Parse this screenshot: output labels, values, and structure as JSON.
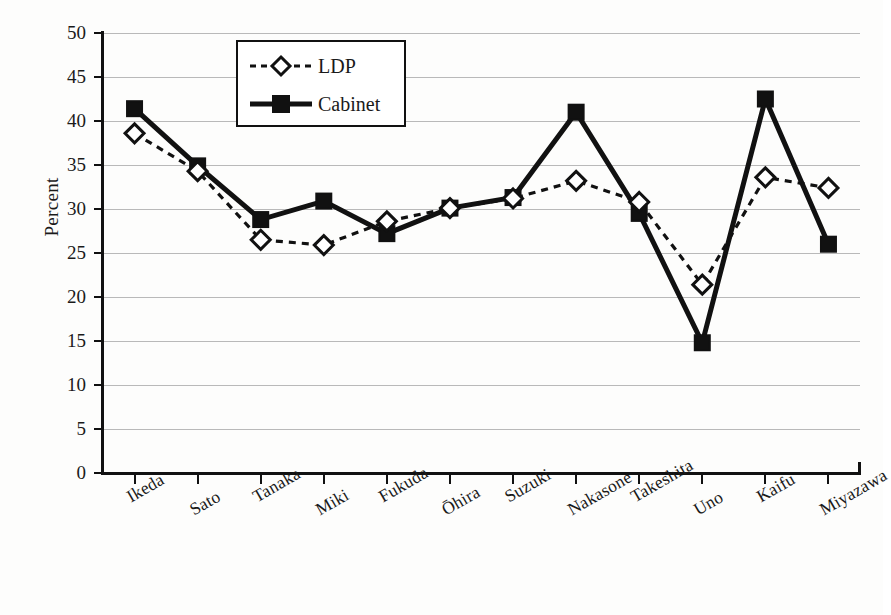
{
  "chart_data": {
    "type": "line",
    "title": "",
    "xlabel": "Politician",
    "ylabel": "Percent",
    "ylim": [
      0,
      50
    ],
    "yticks": [
      0,
      5,
      10,
      15,
      20,
      25,
      30,
      35,
      40,
      45,
      50
    ],
    "grid": "horizontal",
    "legend_position": "top-left-inside",
    "categories": [
      "Ikeda",
      "Sato",
      "Tanaka",
      "Miki",
      "Fukuda",
      "Ōhira",
      "Suzuki",
      "Nakasone",
      "Takeshita",
      "Uno",
      "Kaifu",
      "Miyazawa"
    ],
    "series": [
      {
        "name": "LDP",
        "marker": "diamond-open",
        "line_style": "dashed",
        "color": "#111111",
        "values": [
          38.6,
          34.3,
          26.5,
          25.9,
          28.6,
          30.1,
          31.2,
          33.2,
          30.8,
          21.4,
          33.6,
          32.4
        ]
      },
      {
        "name": "Cabinet",
        "marker": "square-filled",
        "line_style": "solid",
        "color": "#111111",
        "values": [
          41.4,
          34.9,
          28.8,
          30.9,
          27.2,
          30.1,
          31.3,
          41.0,
          29.5,
          14.8,
          42.5,
          26.0
        ]
      }
    ]
  },
  "legend": {
    "items": [
      {
        "label": "LDP"
      },
      {
        "label": "Cabinet"
      }
    ]
  },
  "axes": {
    "y_title": "Percent",
    "x_title": "Politician"
  },
  "colors": {
    "ink": "#111111",
    "gridline": "#b9b9b9",
    "background": "#fdfdfc"
  }
}
